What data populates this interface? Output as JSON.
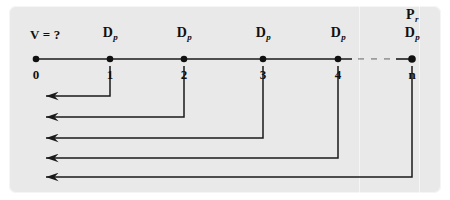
{
  "figure": {
    "kind": "timeline-cash-flow-diagram",
    "background_color": "#ffffff",
    "panel_color": "#e9e9e9",
    "line_color": "#1a1a1a",
    "width": 450,
    "height": 200
  },
  "timeline": {
    "axis_y": 59,
    "start_x": 36,
    "end_x": 412,
    "unknown_label": "V = ?",
    "unknown_label_x": 30,
    "unknown_label_y": 28,
    "ellipsis": "· · ·",
    "ellipsis_x": 375,
    "points": [
      {
        "id": "p0",
        "period_label": "0",
        "x": 36,
        "top_label": "",
        "top_label_sub": "",
        "extra_label": "",
        "extra_label_sub": ""
      },
      {
        "id": "p1",
        "period_label": "1",
        "x": 110,
        "top_label": "D",
        "top_label_sub": "p",
        "extra_label": "",
        "extra_label_sub": ""
      },
      {
        "id": "p2",
        "period_label": "2",
        "x": 184,
        "top_label": "D",
        "top_label_sub": "p",
        "extra_label": "",
        "extra_label_sub": ""
      },
      {
        "id": "p3",
        "period_label": "3",
        "x": 263,
        "top_label": "D",
        "top_label_sub": "p",
        "extra_label": "",
        "extra_label_sub": ""
      },
      {
        "id": "p4",
        "period_label": "4",
        "x": 338,
        "top_label": "D",
        "top_label_sub": "p",
        "extra_label": "",
        "extra_label_sub": ""
      },
      {
        "id": "pn",
        "period_label": "n",
        "x": 412,
        "top_label": "D",
        "top_label_sub": "p",
        "extra_label": "P",
        "extra_label_sub": "r"
      }
    ]
  },
  "flows": {
    "arrow_tip_x": 36,
    "items": [
      {
        "id": "flow-1",
        "from_point": "p1",
        "from_x": 110,
        "y": 96,
        "label": ""
      },
      {
        "id": "flow-2",
        "from_point": "p2",
        "from_x": 184,
        "y": 117,
        "label": ""
      },
      {
        "id": "flow-3",
        "from_point": "p3",
        "from_x": 263,
        "y": 138,
        "label": ""
      },
      {
        "id": "flow-4",
        "from_point": "p4",
        "from_x": 338,
        "y": 158,
        "label": ""
      },
      {
        "id": "flow-5",
        "from_point": "pn",
        "from_x": 412,
        "y": 177,
        "label": ""
      }
    ]
  }
}
